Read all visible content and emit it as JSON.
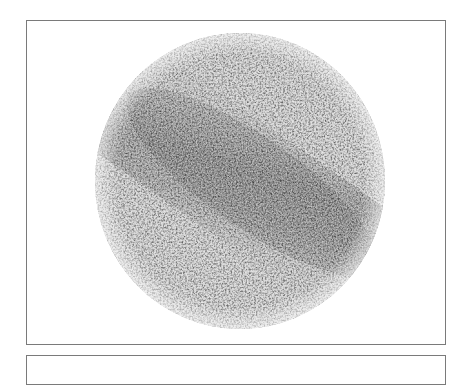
{
  "figure": {
    "panel_count_visible": 2,
    "specimen": {
      "shape": "circle",
      "center": [
        240,
        181
      ],
      "radius_x": 145,
      "radius_y": 148,
      "base_color": "#c8c8c8",
      "band_color": "#8a8a8a",
      "band_direction": "upper-left to lower-right"
    },
    "frame_color": "#7a7a7a",
    "background_color": "#ffffff"
  }
}
